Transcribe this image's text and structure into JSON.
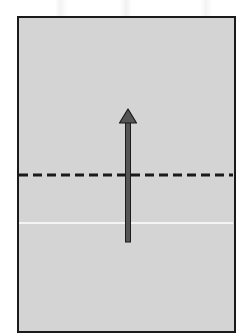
{
  "diagram": {
    "type": "schematic",
    "panel": {
      "fill": "#d4d4d4",
      "border": "#1a1a1a"
    },
    "dashed_line": {
      "y": 175,
      "color": "#1a1a1a",
      "style": "dashed"
    },
    "solid_line": {
      "y": 223,
      "color": "#ffffff",
      "style": "solid"
    },
    "arrow": {
      "direction": "up",
      "x": 128,
      "y_start": 242,
      "y_end": 108,
      "color": "#555555",
      "outline": "#1a1a1a"
    }
  }
}
